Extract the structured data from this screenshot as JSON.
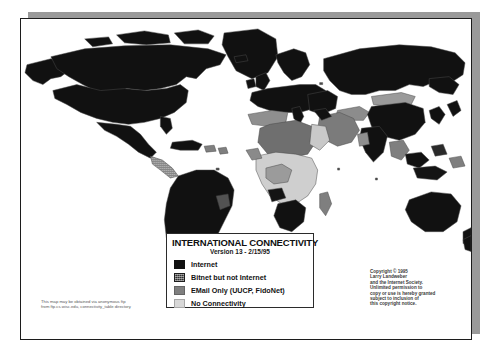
{
  "document": {
    "kind": "scanned-map-page",
    "title": "INTERNATIONAL CONNECTIVITY"
  },
  "legend": {
    "title": "INTERNATIONAL CONNECTIVITY",
    "version": "Version 13 - 2/15/95",
    "items": [
      {
        "label": "Internet",
        "swatch": "black",
        "color": "#111111"
      },
      {
        "label": "Bitnet but not Internet",
        "swatch": "dark-dither",
        "color": "#2e2e2e"
      },
      {
        "label": "EMail Only (UUCP, FidoNet)",
        "swatch": "medium-gray",
        "color": "#7f7f7f"
      },
      {
        "label": "No Connectivity",
        "swatch": "light-gray",
        "color": "#d8d8d8"
      }
    ]
  },
  "copyright": {
    "lines": [
      "Copyright © 1995",
      "Larry Landweber",
      "and the Internet Society.",
      "Unlimited permission to",
      "copy or use is hereby granted",
      "subject to inclusion of",
      "this copyright notice."
    ]
  },
  "ftp_note": {
    "lines": [
      "This map may be obtained via anonymous ftp",
      "from ftp.cs.wisc.edu, connectivity_table directory"
    ]
  },
  "colors": {
    "page_background": "#ffffff",
    "page_border": "#1c1c1c",
    "drop_shadow": "#9a9a9a",
    "ocean": "#ffffff",
    "internet": "#111111",
    "bitnet": "#2e2e2e",
    "email_only": "#7f7f7f",
    "no_connectivity": "#d8d8d8",
    "country_outline": "#4a4a4a"
  },
  "map": {
    "projection": "world-equirectangular",
    "regions": [
      {
        "name": "north-america",
        "class": "internet"
      },
      {
        "name": "greenland",
        "class": "internet"
      },
      {
        "name": "central-america",
        "class": "email_only"
      },
      {
        "name": "south-america",
        "class": "internet"
      },
      {
        "name": "europe",
        "class": "internet"
      },
      {
        "name": "north-africa",
        "class": "email_only"
      },
      {
        "name": "sub-saharan-africa",
        "class": "no_connectivity"
      },
      {
        "name": "southern-africa",
        "class": "internet"
      },
      {
        "name": "middle-east",
        "class": "email_only"
      },
      {
        "name": "russia",
        "class": "internet"
      },
      {
        "name": "central-asia",
        "class": "no_connectivity"
      },
      {
        "name": "east-asia",
        "class": "internet"
      },
      {
        "name": "southeast-asia",
        "class": "email_only"
      },
      {
        "name": "australia",
        "class": "internet"
      },
      {
        "name": "new-zealand",
        "class": "internet"
      }
    ]
  }
}
